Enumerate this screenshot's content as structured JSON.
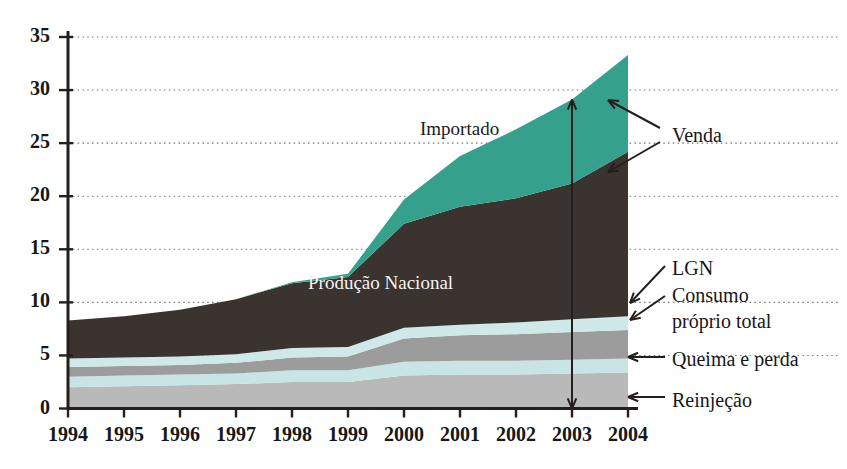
{
  "chart_data": {
    "type": "area",
    "title": "",
    "subtitle": "",
    "xlabel": "",
    "ylabel": "",
    "grid": true,
    "legend_position": "inline-annotations",
    "xlim": [
      1994,
      2004
    ],
    "ylim": [
      0,
      35
    ],
    "yticks": [
      0,
      5,
      10,
      15,
      20,
      25,
      30,
      35
    ],
    "categories": [
      "1994",
      "1995",
      "1996",
      "1997",
      "1998",
      "1999",
      "2000",
      "2001",
      "2002",
      "2003",
      "2004"
    ],
    "x": [
      1994,
      1995,
      1996,
      1997,
      1998,
      1999,
      2000,
      2001,
      2002,
      2003,
      2004
    ],
    "stacking": "stacked-from-bottom",
    "series": [
      {
        "name": "Reinjeção",
        "color": "#b9b9b9",
        "values": [
          2.0,
          2.1,
          2.2,
          2.3,
          2.5,
          2.5,
          3.1,
          3.2,
          3.2,
          3.3,
          3.4
        ]
      },
      {
        "name": "Queima e perda",
        "color": "#c9e4e4",
        "values": [
          1.0,
          1.0,
          1.0,
          1.0,
          1.1,
          1.1,
          1.3,
          1.3,
          1.3,
          1.3,
          1.3
        ]
      },
      {
        "name": "Consumo próprio total",
        "color": "#9c9c9c",
        "values": [
          0.9,
          0.9,
          0.9,
          1.0,
          1.2,
          1.3,
          2.2,
          2.4,
          2.5,
          2.6,
          2.7
        ]
      },
      {
        "name": "LGN",
        "color": "#cfe8e8",
        "values": [
          0.8,
          0.8,
          0.8,
          0.8,
          0.9,
          0.9,
          1.0,
          1.0,
          1.1,
          1.2,
          1.3
        ]
      },
      {
        "name": "Produção Nacional",
        "color": "#3b3330",
        "values": [
          3.6,
          3.9,
          4.4,
          5.2,
          6.1,
          6.6,
          9.8,
          11.1,
          11.7,
          12.8,
          15.5
        ]
      },
      {
        "name": "Importado",
        "color": "#35a18c",
        "values": [
          0.0,
          0.0,
          0.0,
          0.0,
          0.1,
          0.3,
          2.3,
          4.8,
          6.5,
          7.9,
          9.1
        ]
      }
    ],
    "series_cumulative_tops": {
      "Reinjeção": [
        2.0,
        2.1,
        2.2,
        2.3,
        2.5,
        2.5,
        3.1,
        3.2,
        3.2,
        3.3,
        3.4
      ],
      "Queima e perda": [
        3.0,
        3.1,
        3.2,
        3.3,
        3.6,
        3.6,
        4.4,
        4.5,
        4.5,
        4.6,
        4.7
      ],
      "Consumo próprio total": [
        3.9,
        4.0,
        4.1,
        4.3,
        4.8,
        4.9,
        6.6,
        6.9,
        7.0,
        7.2,
        7.4
      ],
      "LGN": [
        4.7,
        4.8,
        4.9,
        5.1,
        5.7,
        5.8,
        7.6,
        7.9,
        8.1,
        8.4,
        8.7
      ],
      "Produção Nacional": [
        8.3,
        8.7,
        9.3,
        10.3,
        11.8,
        12.4,
        17.4,
        19.0,
        19.8,
        21.2,
        24.2
      ],
      "Importado": [
        8.3,
        8.7,
        9.3,
        10.3,
        11.9,
        12.7,
        19.7,
        23.8,
        26.3,
        29.1,
        33.3
      ]
    },
    "inline_labels": [
      {
        "text": "Importado",
        "color_class": "dark",
        "x_px": 420,
        "y_px": 118
      },
      {
        "text": "Produção Nacional",
        "color_class": "light",
        "x_px": 308,
        "y_px": 272
      }
    ],
    "annotations": [
      {
        "name": "venda",
        "text": "Venda",
        "x_px": 672,
        "y_px": 124
      },
      {
        "name": "lgn",
        "text": "LGN",
        "x_px": 672,
        "y_px": 262
      },
      {
        "name": "consumo-proprio-total",
        "text": "Consumo\npróprio total",
        "x_px": 672,
        "y_px": 288
      },
      {
        "name": "queima-e-perda",
        "text": "Queima e perda",
        "x_px": 672,
        "y_px": 350
      },
      {
        "name": "reinjecao",
        "text": "Reinjeção",
        "x_px": 672,
        "y_px": 391
      }
    ],
    "measure_arrow": {
      "name": "venda-span-arrow",
      "at_year": "2003",
      "from_value": 0,
      "to_value": 29.1,
      "double_headed": true
    }
  },
  "axis": {
    "y_tick_labels": [
      "35",
      "30",
      "25",
      "20",
      "15",
      "10",
      "5",
      "0"
    ],
    "x_tick_labels": [
      "1994",
      "1995",
      "1996",
      "1997",
      "1998",
      "1999",
      "2000",
      "2001",
      "2002",
      "2003",
      "2004"
    ]
  },
  "labels": {
    "importado": "Importado",
    "producao_nacional": "Produção Nacional",
    "venda": "Venda",
    "lgn": "LGN",
    "consumo_1": "Consumo",
    "consumo_2": "próprio total",
    "queima": "Queima e perda",
    "reinjecao": "Reinjeção"
  },
  "colors": {
    "importado": "#35a18c",
    "producao_nacional": "#3b3330",
    "lgn": "#cfe8e8",
    "consumo_proprio_total": "#9c9c9c",
    "queima_e_perda": "#c9e4e4",
    "reinjecao": "#b9b9b9",
    "axis": "#241f1e",
    "grid": "#7b7b7b",
    "background": "#ffffff"
  }
}
